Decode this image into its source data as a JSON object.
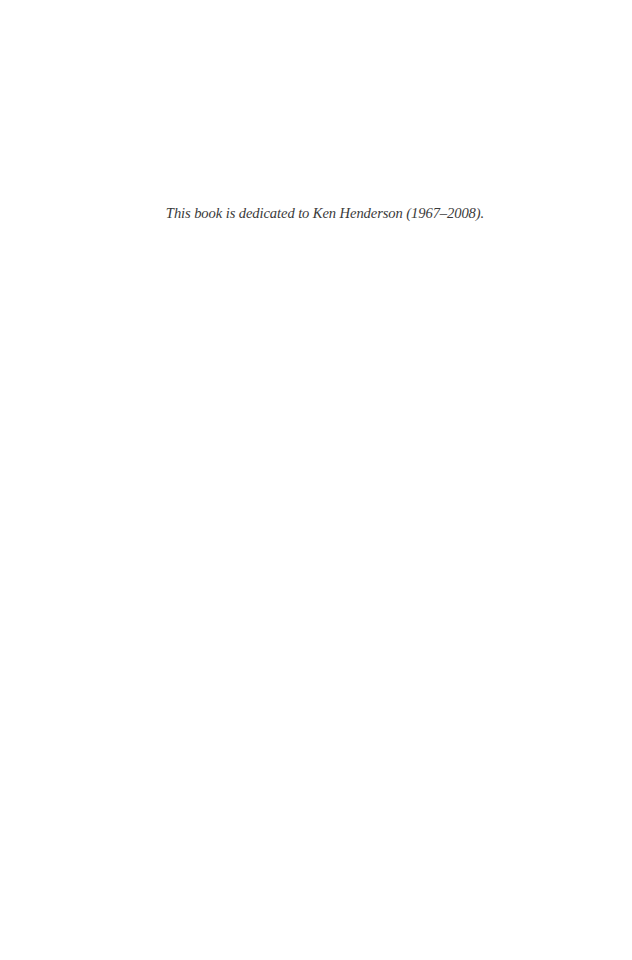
{
  "page": {
    "background_color": "#ffffff",
    "text_color": "#3a3a3a"
  },
  "dedication": {
    "text": "This book is dedicated to Ken Henderson (1967–2008)."
  }
}
